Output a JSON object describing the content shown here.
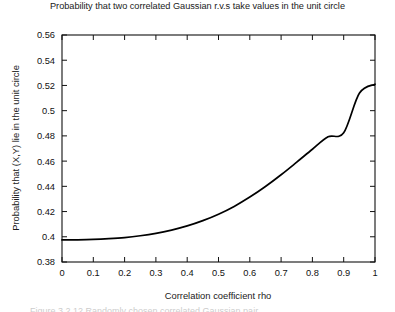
{
  "chart_data": {
    "type": "line",
    "title": "Probability that two correlated Gaussian r.v.s take values in the unit circle",
    "xlabel": "Correlation coefficient rho",
    "ylabel": "Probability that (X,Y) lie in the unit circle",
    "xlim": [
      0,
      1
    ],
    "ylim": [
      0.38,
      0.56
    ],
    "grid": false,
    "legend": null,
    "xticks": [
      0,
      0.1,
      0.2,
      0.3,
      0.4,
      0.5,
      0.6,
      0.7,
      0.8,
      0.9,
      1
    ],
    "xtick_labels": [
      "0",
      "0.1",
      "0.2",
      "0.3",
      "0.4",
      "0.5",
      "0.6",
      "0.7",
      "0.8",
      "0.9",
      "1"
    ],
    "yticks": [
      0.38,
      0.4,
      0.42,
      0.44,
      0.46,
      0.48,
      0.5,
      0.52,
      0.54,
      0.56
    ],
    "ytick_labels": [
      "0.38",
      "0.4",
      "0.42",
      "0.44",
      "0.46",
      "0.48",
      "0.5",
      "0.52",
      "0.54",
      "0.56"
    ],
    "series": [
      {
        "name": "P((X,Y) in unit circle)",
        "color": "#000000",
        "x": [
          0,
          0.05,
          0.1,
          0.15,
          0.2,
          0.25,
          0.3,
          0.35,
          0.4,
          0.45,
          0.5,
          0.55,
          0.6,
          0.65,
          0.7,
          0.75,
          0.8,
          0.85,
          0.9,
          0.95,
          1
        ],
        "values": [
          0.3975,
          0.3976,
          0.3979,
          0.3985,
          0.3994,
          0.4008,
          0.4027,
          0.4053,
          0.4086,
          0.4128,
          0.4179,
          0.4241,
          0.4315,
          0.4399,
          0.4492,
          0.4592,
          0.4694,
          0.4793,
          0.4825,
          0.5138,
          0.521
        ]
      }
    ]
  },
  "axes": {
    "x_label_text": "Correlation coefficient rho",
    "y_label_text": "Probability that (X,Y) lie in the unit circle"
  },
  "caption": {
    "sliver_text": "Figure 3.2.12   Randomly chosen correlated Gaussian pair"
  },
  "colors": {
    "background": "#ffffff",
    "axis": "#111111",
    "curve": "#000000",
    "text": "#1a1a1a"
  }
}
